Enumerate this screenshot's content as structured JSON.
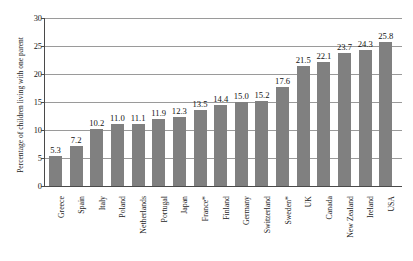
{
  "chart_data": {
    "type": "bar",
    "title": "",
    "subtitle": "",
    "xlabel": "",
    "ylabel": "Percentage of children living with one parent",
    "ylim": [
      0,
      30
    ],
    "ytick_labels": [
      "0",
      "5",
      "10",
      "15",
      "20",
      "25",
      "30"
    ],
    "yticks": [
      0,
      5,
      10,
      15,
      20,
      25,
      30
    ],
    "grid": "horizontal",
    "legend": "none",
    "bar_color": "#808080",
    "categories": [
      "Greece",
      "Spain",
      "Italy",
      "Poland",
      "Netherlands",
      "Portugal",
      "Japan",
      "France*",
      "Finland",
      "Germany",
      "Switzerland",
      "Sweden*",
      "UK",
      "Canada",
      "New Zealand",
      "Ireland",
      "USA"
    ],
    "values": [
      5.3,
      7.2,
      10.2,
      11.0,
      11.1,
      11.9,
      12.3,
      13.5,
      14.4,
      15.0,
      15.2,
      17.6,
      21.5,
      22.1,
      23.7,
      24.3,
      25.8
    ],
    "value_labels": [
      "5.3",
      "7.2",
      "10.2",
      "11.0",
      "11.1",
      "11.9",
      "12.3",
      "13.5",
      "14.4",
      "15.0",
      "15.2",
      "17.6",
      "21.5",
      "22.1",
      "23.7",
      "24.3",
      "25.8"
    ],
    "annotations": [
      "* asterisk marks France and Sweden"
    ]
  }
}
